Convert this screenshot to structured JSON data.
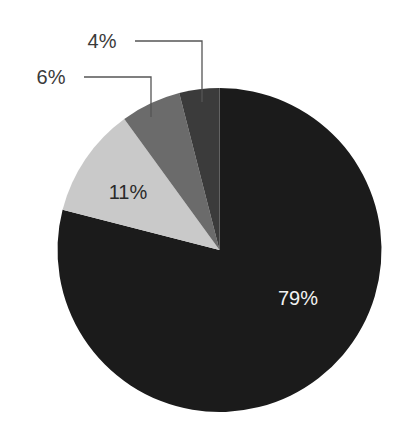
{
  "chart_data": {
    "type": "pie",
    "title": "",
    "start_angle_deg": 0,
    "direction": "clockwise",
    "center": [
      219.5,
      250
    ],
    "radius": 162,
    "slices": [
      {
        "label": "79%",
        "value": 79,
        "color": "#1b1b1b",
        "label_color": "#f2f2f2",
        "label_pos": "inside",
        "label_xy": [
          298,
          298
        ]
      },
      {
        "label": "11%",
        "value": 11,
        "color": "#c9c9c9",
        "label_color": "#2a2a2a",
        "label_pos": "inside",
        "label_xy": [
          128,
          192
        ]
      },
      {
        "label": "6%",
        "value": 6,
        "color": "#6b6b6b",
        "label_color": "#3a3a3a",
        "label_pos": "outside",
        "label_xy": [
          51,
          77
        ],
        "leader": [
          [
            84,
            77
          ],
          [
            151,
            77
          ],
          [
            151,
            117
          ]
        ]
      },
      {
        "label": "4%",
        "value": 4,
        "color": "#3b3b3b",
        "label_color": "#3a3a3a",
        "label_pos": "outside",
        "label_xy": [
          102,
          41
        ],
        "leader": [
          [
            135,
            41
          ],
          [
            202,
            41
          ],
          [
            202,
            102
          ]
        ]
      }
    ],
    "legend": null,
    "leader_line_color": "#555555"
  }
}
